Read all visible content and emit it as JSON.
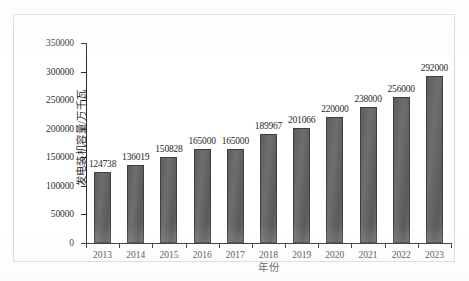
{
  "chart_data": {
    "type": "bar",
    "title": "",
    "xlabel": "年份",
    "ylabel": "发电装机容量/万千瓦",
    "categories": [
      "2013",
      "2014",
      "2015",
      "2016",
      "2017",
      "2018",
      "2019",
      "2020",
      "2021",
      "2022",
      "2023"
    ],
    "values": [
      124738,
      136019,
      150828,
      165000,
      165000,
      189967,
      201066,
      220000,
      238000,
      256000,
      292000
    ],
    "value_labels": [
      "124738",
      "136019",
      "150828",
      "165000",
      "165000",
      "189967",
      "201066",
      "220000",
      "238000",
      "256000",
      "292000"
    ],
    "ylim": [
      0,
      350000
    ],
    "ytick_values": [
      0,
      50000,
      100000,
      150000,
      200000,
      250000,
      300000,
      350000
    ],
    "ytick_labels": [
      "0",
      "50000",
      "100000",
      "150000",
      "200000",
      "250000",
      "300000",
      "350000"
    ],
    "grid": false,
    "legend": false,
    "legend_position": "none",
    "bar_color": "#646464",
    "bar_edge_color": "#3f3f3f",
    "axis_color": "#2b2b2b",
    "frame_color": "#d6d6d6",
    "background_color": "#ffffff"
  }
}
